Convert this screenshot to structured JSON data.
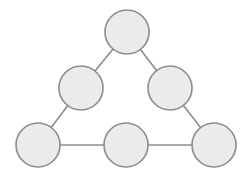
{
  "diagram": {
    "type": "graph",
    "colors": {
      "node_fill": "#ebebeb",
      "node_stroke": "#8c8c8c",
      "edge": "#8c8c8c",
      "background": "#ffffff"
    },
    "nodes": [
      {
        "id": "top",
        "cx": 127,
        "cy": 32,
        "r": 22
      },
      {
        "id": "mid-left",
        "cx": 81,
        "cy": 88,
        "r": 22
      },
      {
        "id": "mid-right",
        "cx": 170,
        "cy": 88,
        "r": 22
      },
      {
        "id": "bottom-left",
        "cx": 38,
        "cy": 145,
        "r": 22
      },
      {
        "id": "bottom-mid",
        "cx": 126,
        "cy": 145,
        "r": 22
      },
      {
        "id": "bottom-right",
        "cx": 214,
        "cy": 145,
        "r": 22
      }
    ],
    "edges": [
      {
        "from": "top",
        "to": "mid-left"
      },
      {
        "from": "top",
        "to": "mid-right"
      },
      {
        "from": "mid-left",
        "to": "bottom-left"
      },
      {
        "from": "mid-right",
        "to": "bottom-right"
      },
      {
        "from": "bottom-left",
        "to": "bottom-mid"
      },
      {
        "from": "bottom-mid",
        "to": "bottom-right"
      }
    ]
  }
}
